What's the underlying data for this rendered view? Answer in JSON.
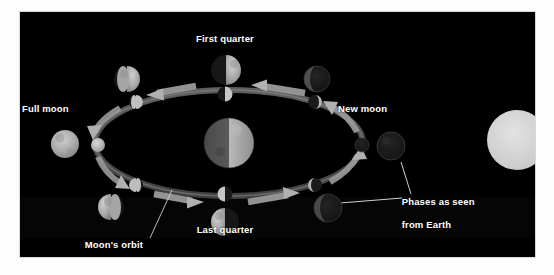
{
  "page": {
    "background_color": "#ffffff",
    "panel_color": "#000000",
    "text_color": "#ffffff"
  },
  "diagram": {
    "title_semantic": "phases-of-the-moon-diagram",
    "labels": {
      "first_quarter": "First quarter",
      "full_moon": "Full moon",
      "new_moon": "New moon",
      "last_quarter": "Last quarter",
      "orbit_line1": "Moon's orbit",
      "orbit_line2": "around Earth",
      "phases_line1": "Phases as seen",
      "phases_line2": "from Earth"
    },
    "bodies": {
      "earth": {
        "name": "Earth",
        "cx": 209,
        "cy": 131,
        "r": 25,
        "lit_side": "right"
      },
      "sun": {
        "name": "Sun",
        "cx": 497,
        "cy": 128,
        "r": 30,
        "lit_side": "full"
      }
    },
    "orbit": {
      "center_x": 209,
      "center_y": 131,
      "radius_x": 134,
      "radius_y": 53,
      "direction": "counterclockwise"
    },
    "orbit_moons": [
      {
        "name": "orbit-moon-first-quarter",
        "cx": 205,
        "cy": 82,
        "r": 7.5,
        "lit": "right"
      },
      {
        "name": "orbit-moon-waxing-gibbous",
        "cx": 116,
        "cy": 90,
        "r": 7,
        "lit": "right-wide"
      },
      {
        "name": "orbit-moon-full",
        "cx": 78,
        "cy": 133,
        "r": 7,
        "lit": "full"
      },
      {
        "name": "orbit-moon-waning-gibbous",
        "cx": 116,
        "cy": 173,
        "r": 7,
        "lit": "left-wide"
      },
      {
        "name": "orbit-moon-last-quarter",
        "cx": 205,
        "cy": 182,
        "r": 7.5,
        "lit": "left"
      },
      {
        "name": "orbit-moon-waning-crescent",
        "cx": 295,
        "cy": 173,
        "r": 7,
        "lit": "left-thin"
      },
      {
        "name": "orbit-moon-new",
        "cx": 342,
        "cy": 133,
        "r": 7,
        "lit": "none"
      },
      {
        "name": "orbit-moon-waxing-crescent",
        "cx": 295,
        "cy": 90,
        "r": 7,
        "lit": "right-thin"
      }
    ],
    "phase_moons": [
      {
        "name": "phase-moon-first-quarter",
        "cx": 206,
        "cy": 58,
        "r": 15,
        "phase": "first-quarter",
        "lit": "right-half"
      },
      {
        "name": "phase-moon-waxing-gibbous",
        "cx": 107,
        "cy": 67,
        "r": 13,
        "phase": "waxing-gibbous",
        "lit": "gibbous-right"
      },
      {
        "name": "phase-moon-full",
        "cx": 45,
        "cy": 132,
        "r": 14,
        "phase": "full",
        "lit": "full"
      },
      {
        "name": "phase-moon-waning-gibbous",
        "cx": 91,
        "cy": 195,
        "r": 13,
        "phase": "waning-gibbous",
        "lit": "gibbous-left"
      },
      {
        "name": "phase-moon-last-quarter",
        "cx": 205,
        "cy": 210,
        "r": 14,
        "phase": "last-quarter",
        "lit": "left-half"
      },
      {
        "name": "phase-moon-waning-crescent",
        "cx": 308,
        "cy": 196,
        "r": 14,
        "phase": "waning-crescent",
        "lit": "crescent-left"
      },
      {
        "name": "phase-moon-new",
        "cx": 371,
        "cy": 134,
        "r": 14,
        "phase": "new",
        "lit": "none"
      },
      {
        "name": "phase-moon-waxing-crescent",
        "cx": 297,
        "cy": 67,
        "r": 13,
        "phase": "waxing-crescent",
        "lit": "crescent-right"
      }
    ],
    "arrows": [
      {
        "name": "orbit-arrow-top-right",
        "direction": "left"
      },
      {
        "name": "orbit-arrow-top-left",
        "direction": "left"
      },
      {
        "name": "orbit-arrow-bottom-left",
        "direction": "right"
      },
      {
        "name": "orbit-arrow-bottom-right",
        "direction": "right"
      }
    ],
    "leader_lines": [
      {
        "name": "leader-line-orbit",
        "from": "Moon's orbit label",
        "to": "orbit ellipse"
      },
      {
        "name": "leader-line-phases-upper",
        "from": "Phases as seen from Earth label",
        "to": "new moon phase circle"
      },
      {
        "name": "leader-line-phases-lower",
        "from": "Phases as seen from Earth label",
        "to": "waning crescent phase circle"
      }
    ]
  }
}
